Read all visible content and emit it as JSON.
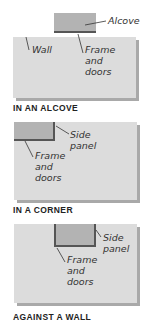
{
  "diagrams": [
    {
      "caption": "IN AN ALCOVE",
      "labels": {
        "alcove": "Alcove",
        "wall": "Wall",
        "frame": "Frame\nand\ndoors"
      }
    },
    {
      "caption": "IN A CORNER",
      "labels": {
        "side_panel": "Side\npanel",
        "frame": "Frame\nand\ndoors"
      }
    },
    {
      "caption": "AGAINST A WALL",
      "labels": {
        "side_panel": "Side\npanel",
        "frame": "Frame\nand\ndoors"
      }
    }
  ],
  "colors": {
    "wall": "#dcdcdc",
    "unit": "#b3b3b3",
    "edge": "#555555",
    "shadow": "#a9a9a9"
  }
}
